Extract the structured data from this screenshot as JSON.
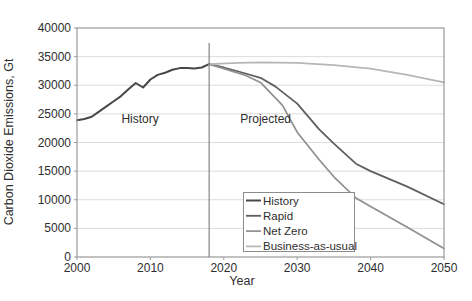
{
  "chart_data": {
    "type": "line",
    "title": "",
    "xlabel": "Year",
    "ylabel": "Carbon Dioxide Emissions, Gt",
    "xlim": [
      2000,
      2050
    ],
    "ylim": [
      0,
      40000
    ],
    "x_ticks": [
      2000,
      2010,
      2020,
      2030,
      2040,
      2050
    ],
    "y_ticks": [
      0,
      5000,
      10000,
      15000,
      20000,
      25000,
      30000,
      35000,
      40000
    ],
    "grid": "horizontal",
    "grid_color": "#dcdcdc",
    "axis_color": "#9a9a9a",
    "text_color": "#2e2e2e",
    "divider": {
      "year": 2018,
      "top_value": 37400,
      "color": "#6e6e6e"
    },
    "annotations": [
      {
        "text": "History",
        "x": 2008.6,
        "y": 23400
      },
      {
        "text": "Projected",
        "x": 2025.7,
        "y": 23400
      }
    ],
    "legend_position": "inside bottom-right",
    "series": [
      {
        "name": "History",
        "color": "#484848",
        "width": 2,
        "points": [
          [
            2000,
            23900
          ],
          [
            2001,
            24100
          ],
          [
            2002,
            24500
          ],
          [
            2003,
            25400
          ],
          [
            2004,
            26300
          ],
          [
            2005,
            27200
          ],
          [
            2006,
            28100
          ],
          [
            2007,
            29300
          ],
          [
            2008,
            30400
          ],
          [
            2009,
            29600
          ],
          [
            2010,
            31000
          ],
          [
            2011,
            31800
          ],
          [
            2012,
            32200
          ],
          [
            2013,
            32700
          ],
          [
            2014,
            33000
          ],
          [
            2015,
            33000
          ],
          [
            2016,
            32900
          ],
          [
            2017,
            33100
          ],
          [
            2018,
            33700
          ]
        ]
      },
      {
        "name": "Rapid",
        "color": "#5f5f5f",
        "width": 1.8,
        "points": [
          [
            2018,
            33700
          ],
          [
            2020,
            33100
          ],
          [
            2022,
            32400
          ],
          [
            2025,
            31300
          ],
          [
            2027,
            29800
          ],
          [
            2030,
            26800
          ],
          [
            2033,
            22300
          ],
          [
            2035,
            19800
          ],
          [
            2038,
            16300
          ],
          [
            2040,
            15000
          ],
          [
            2045,
            12300
          ],
          [
            2050,
            9200
          ]
        ]
      },
      {
        "name": "Net Zero",
        "color": "#8f8f8f",
        "width": 1.7,
        "points": [
          [
            2018,
            33700
          ],
          [
            2020,
            32900
          ],
          [
            2023,
            31700
          ],
          [
            2025,
            30500
          ],
          [
            2028,
            26500
          ],
          [
            2030,
            21800
          ],
          [
            2033,
            17000
          ],
          [
            2035,
            14000
          ],
          [
            2038,
            10300
          ],
          [
            2040,
            8800
          ],
          [
            2045,
            5200
          ],
          [
            2050,
            1500
          ]
        ]
      },
      {
        "name": "Business-as-usual",
        "color": "#b6b6b6",
        "width": 1.7,
        "points": [
          [
            2018,
            33700
          ],
          [
            2022,
            33900
          ],
          [
            2025,
            34000
          ],
          [
            2030,
            33900
          ],
          [
            2035,
            33500
          ],
          [
            2040,
            32900
          ],
          [
            2045,
            31800
          ],
          [
            2050,
            30500
          ]
        ]
      }
    ]
  }
}
